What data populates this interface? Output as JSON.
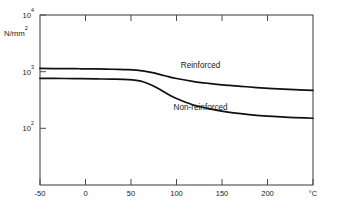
{
  "chart_data": {
    "type": "line",
    "title": "",
    "subtitle": "",
    "xlabel": "",
    "ylabel": "N/mm",
    "ylabel_exponent": "2",
    "x_unit": "°C",
    "xlim": [
      -50,
      290
    ],
    "ylim": [
      100,
      10000
    ],
    "yscale": "log",
    "xscale": "linear",
    "grid": false,
    "legend_position": "inline-annotations",
    "x_ticks": [
      -50,
      0,
      50,
      100,
      150,
      200,
      250
    ],
    "x_tick_labels": [
      "-50",
      "0",
      "50",
      "100",
      "150",
      "200",
      "250"
    ],
    "y_ticks": [
      100,
      1000,
      10000
    ],
    "y_tick_labels": [
      "10",
      "10",
      "10"
    ],
    "y_tick_exponents": [
      "2",
      "3",
      "4"
    ],
    "y_tick_label_full": [
      "10^2",
      "10^3",
      "10^4"
    ],
    "series": [
      {
        "name": "Reinforced",
        "label": "Reinforced",
        "label_x": 150,
        "label_y": 2400,
        "x": [
          -50,
          -20,
          0,
          20,
          40,
          60,
          70,
          80,
          90,
          100,
          110,
          120,
          140,
          160,
          180,
          200,
          220,
          240,
          260,
          280,
          290
        ],
        "values": [
          2350,
          2340,
          2330,
          2320,
          2300,
          2280,
          2250,
          2190,
          2100,
          1990,
          1880,
          1790,
          1660,
          1570,
          1500,
          1450,
          1400,
          1360,
          1330,
          1310,
          1300
        ]
      },
      {
        "name": "Non-reinforced",
        "label": "Non-reinforced",
        "label_x": 150,
        "label_y": 760,
        "x": [
          -50,
          -20,
          0,
          20,
          40,
          60,
          70,
          80,
          90,
          100,
          110,
          120,
          140,
          160,
          180,
          200,
          220,
          240,
          260,
          280,
          290
        ],
        "values": [
          1800,
          1790,
          1780,
          1770,
          1760,
          1740,
          1700,
          1620,
          1480,
          1320,
          1160,
          1040,
          880,
          790,
          730,
          690,
          660,
          640,
          625,
          615,
          610
        ]
      }
    ]
  },
  "axes": {
    "y_axis_label": "N/mm",
    "y_axis_label_sup": "2",
    "x_axis_unit": "°C"
  },
  "colors": {
    "curve": "#111111",
    "axis": "#4a4a4a",
    "background": "#ffffff",
    "text": "#1a1a1a"
  }
}
